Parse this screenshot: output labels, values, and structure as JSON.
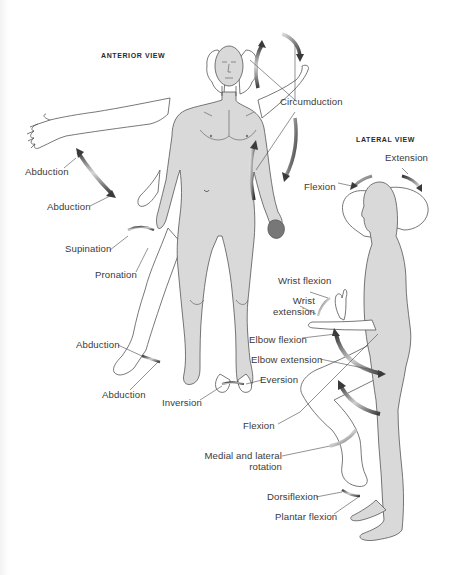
{
  "views": {
    "anterior": {
      "heading": "ANTERIOR VIEW"
    },
    "lateral": {
      "heading": "LATERAL VIEW"
    }
  },
  "labels": {
    "circumduction": "Circumduction",
    "abduction_arm_upper": "Abduction",
    "abduction_arm_lower": "Abduction",
    "supination": "Supination",
    "pronation": "Pronation",
    "abduction_leg_upper": "Abduction",
    "abduction_leg_lower": "Abduction",
    "inversion": "Inversion",
    "eversion": "Eversion",
    "neck_extension": "Extension",
    "neck_flexion": "Flexion",
    "wrist_flexion": "Wrist flexion",
    "wrist_extension_line1": "Wrist",
    "wrist_extension_line2": "extension",
    "elbow_flexion": "Elbow flexion",
    "elbow_extension": "Elbow extension",
    "hip_flexion": "Flexion",
    "rotation_line1": "Medial and lateral",
    "rotation_line2": "rotation",
    "dorsiflexion": "Dorsiflexion",
    "plantar_flexion": "Plantar flexion"
  },
  "colors": {
    "skin_fill": "#d9d9d9",
    "outline": "#555555",
    "arrow_dark": "#444444",
    "label_text": "#3a3a3a",
    "leader_line": "#4a4a4a"
  }
}
